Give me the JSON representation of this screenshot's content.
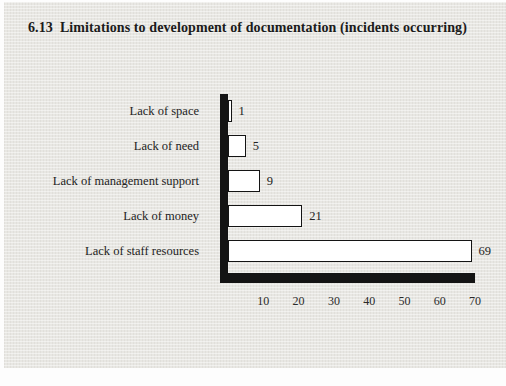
{
  "figure": {
    "number": "6.13",
    "title_text": "Limitations to development of documentation (incidents occurring)"
  },
  "colors": {
    "card_background": "#e8e7e3",
    "bar_fill": "#ffffff",
    "bar_border": "#141414",
    "axis": "#141414",
    "text": "#222222"
  },
  "chart_data": {
    "type": "bar",
    "orientation": "horizontal",
    "categories": [
      "Lack of space",
      "Lack of need",
      "Lack of management support",
      "Lack of money",
      "Lack of staff resources"
    ],
    "values": [
      1,
      5,
      9,
      21,
      69
    ],
    "value_labels_shown": true,
    "xlabel": "",
    "ylabel": "",
    "xlim": [
      0,
      72
    ],
    "xticks": [
      10,
      20,
      30,
      40,
      50,
      60,
      70
    ],
    "grid": false,
    "legend": "none"
  }
}
